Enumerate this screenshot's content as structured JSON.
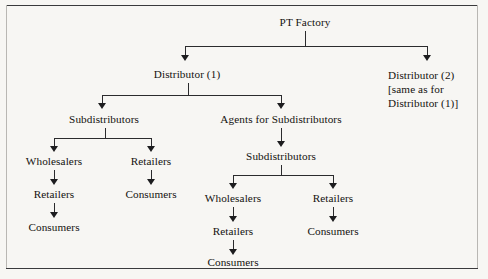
{
  "diagram": {
    "type": "organizational-tree",
    "root": {
      "label": "PT Factory"
    },
    "level1": {
      "left": {
        "label": "Distributor (1)"
      },
      "right": {
        "line1": "Distributor (2)",
        "line2": "[same as for",
        "line3": "Distributor (1)]"
      }
    },
    "level2": {
      "left": {
        "label": "Subdistributors"
      },
      "right": {
        "label": "Agents for Subdistributors"
      }
    },
    "level3": {
      "right_subdistributors": {
        "label": "Subdistributors"
      }
    },
    "branch_left_subdistributors": {
      "wholesalers": "Wholesalers",
      "wholesalers_retailers": "Retailers",
      "wholesalers_consumers": "Consumers",
      "retailers": "Retailers",
      "retailers_consumers": "Consumers"
    },
    "branch_right_subdistributors": {
      "wholesalers": "Wholesalers",
      "wholesalers_retailers": "Retailers",
      "wholesalers_consumers": "Consumers",
      "retailers": "Retailers",
      "retailers_consumers": "Consumers"
    },
    "colors": {
      "ink": "#14120f",
      "connector": "#2b2b2d",
      "frame": "#3a3a3c",
      "page": "#f7f6f3"
    }
  }
}
